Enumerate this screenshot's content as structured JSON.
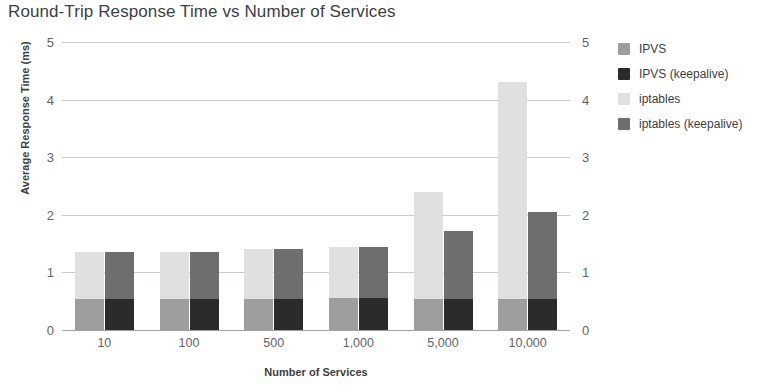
{
  "chart_data": {
    "type": "bar",
    "title": "Round-Trip Response Time vs Number of Services",
    "xlabel": "Number of Services",
    "ylabel": "Average Response Time (ms)",
    "categories": [
      "10",
      "100",
      "500",
      "1,000",
      "5,000",
      "10,000"
    ],
    "ylim": [
      0,
      5
    ],
    "yticks": [
      "0",
      "1",
      "2",
      "3",
      "4",
      "5"
    ],
    "y_axis_right_mirrored": true,
    "grid": true,
    "stacked": true,
    "legend_position": "right",
    "bar_layout": "two stacked bars per category: left = IPVS base + iptables top, right = IPVS (keepalive) base + iptables (keepalive) top",
    "series": [
      {
        "name": "IPVS",
        "color": "#9e9e9e",
        "stack": "left",
        "role": "base",
        "values": [
          0.54,
          0.54,
          0.54,
          0.55,
          0.54,
          0.54
        ]
      },
      {
        "name": "iptables",
        "color": "#e0e0e0",
        "stack": "left",
        "role": "top",
        "values": [
          1.36,
          1.36,
          1.41,
          1.45,
          2.39,
          4.3
        ]
      },
      {
        "name": "IPVS (keepalive)",
        "color": "#2b2b2b",
        "stack": "right",
        "role": "base",
        "values": [
          0.54,
          0.54,
          0.54,
          0.55,
          0.54,
          0.54
        ]
      },
      {
        "name": "iptables (keepalive)",
        "color": "#6e6e6e",
        "stack": "right",
        "role": "top",
        "values": [
          1.36,
          1.36,
          1.41,
          1.44,
          1.72,
          2.05
        ]
      }
    ]
  },
  "legend": {
    "items": [
      {
        "label": "IPVS",
        "color": "#9e9e9e"
      },
      {
        "label": "IPVS (keepalive)",
        "color": "#2b2b2b"
      },
      {
        "label": "iptables",
        "color": "#e0e0e0"
      },
      {
        "label": "iptables (keepalive)",
        "color": "#6e6e6e"
      }
    ]
  }
}
